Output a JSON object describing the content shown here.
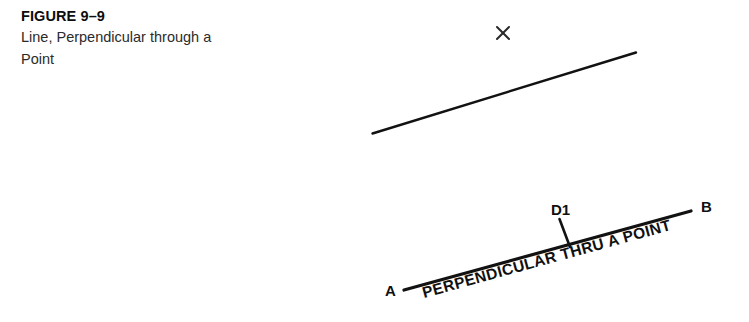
{
  "page": {
    "background_color": "#ffffff",
    "ink_color": "#121212",
    "width": 749,
    "height": 322
  },
  "caption": {
    "figure_label": "FIGURE 9–9",
    "description_line_1": "Line, Perpendicular through a",
    "description_line_2": "Point"
  },
  "diagram": {
    "upper": {
      "point_marker_glyph": "×",
      "point_marker_name": "x-point-mark",
      "line_name": "given-line"
    },
    "lower": {
      "label_a": "A",
      "label_b": "B",
      "label_d1": "D1",
      "annotation_text": "PERPENDICULAR THRU A POINT",
      "perpendicular_tick_name": "perpendicular-segment"
    }
  }
}
